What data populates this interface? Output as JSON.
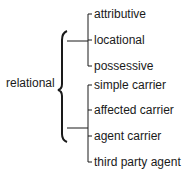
{
  "root": {
    "label": "relational"
  },
  "groups": [
    {
      "items": [
        "attributive",
        "locational",
        "possessive"
      ]
    },
    {
      "items": [
        "simple carrier",
        "affected carrier",
        "agent carrier",
        "third party agent"
      ]
    }
  ],
  "colors": {
    "line": "#1a1a1a",
    "text": "#1a1a1a",
    "background": "#ffffff"
  }
}
